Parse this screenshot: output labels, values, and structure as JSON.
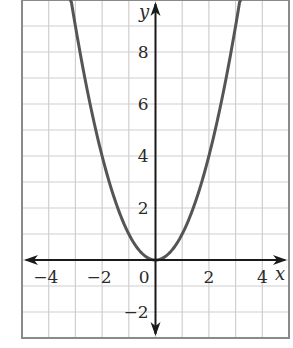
{
  "chart_data": {
    "type": "line",
    "title": "",
    "xlabel": "x",
    "ylabel": "y",
    "xlim": [
      -5,
      5
    ],
    "ylim": [
      -3,
      10
    ],
    "grid": true,
    "x_ticks": [
      -4,
      -2,
      0,
      2,
      4
    ],
    "y_ticks": [
      -2,
      2,
      4,
      6,
      8
    ],
    "x_tick_labels": [
      "−4",
      "−2",
      "0",
      "2",
      "4"
    ],
    "y_tick_labels": [
      "−2",
      "2",
      "4",
      "6",
      "8"
    ],
    "series": [
      {
        "name": "y = x^2",
        "x": [
          -3.2,
          -3,
          -2.5,
          -2,
          -1.5,
          -1,
          -0.5,
          0,
          0.5,
          1,
          1.5,
          2,
          2.5,
          3,
          3.2
        ],
        "y": [
          10.24,
          9,
          6.25,
          4,
          2.25,
          1,
          0.25,
          0,
          0.25,
          1,
          2.25,
          4,
          6.25,
          9,
          10.24
        ]
      }
    ],
    "colors": {
      "curve": "#555555",
      "axis": "#1a1a1a",
      "grid": "#cfcfcf",
      "border": "#8a8a8a"
    }
  }
}
